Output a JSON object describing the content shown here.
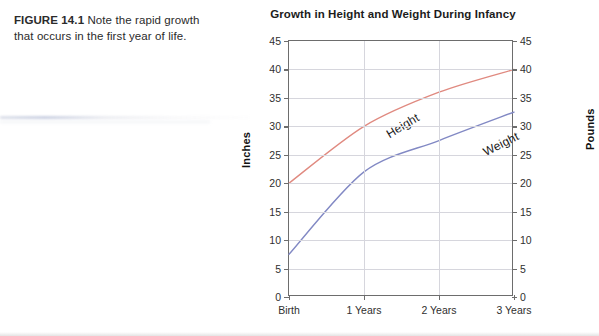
{
  "caption": {
    "label": "FIGURE 14.1",
    "text": "Note the rapid growth that occurs in the first year of life."
  },
  "chart_data": {
    "type": "line",
    "title": "Growth in Height and Weight During Infancy",
    "categories": [
      "Birth",
      "1 Years",
      "2 Years",
      "3 Years"
    ],
    "series": [
      {
        "name": "Height",
        "unit": "Inches",
        "axis": "left",
        "color": "#e08a80",
        "values": [
          20,
          30,
          36,
          40
        ]
      },
      {
        "name": "Weight",
        "unit": "Pounds",
        "axis": "right",
        "color": "#8289c4",
        "values": [
          7.5,
          22,
          27.5,
          32.5
        ]
      }
    ],
    "xlabel": "",
    "ylabel_left": "Inches",
    "ylabel_right": "Pounds",
    "ylim": [
      0,
      45
    ],
    "ytick_step": 5,
    "yticks": [
      0,
      5,
      10,
      15,
      20,
      25,
      30,
      35,
      40,
      45
    ],
    "grid": true,
    "legend": "inline-series-labels"
  }
}
